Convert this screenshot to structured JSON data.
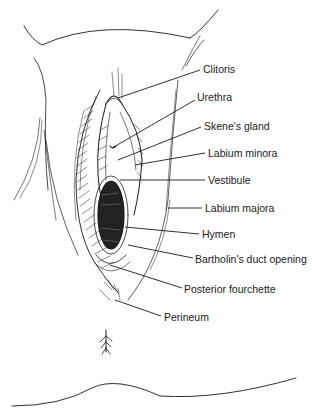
{
  "diagram": {
    "style": "black ink line drawing on white",
    "colors": {
      "ink": "#1a1a1a",
      "background": "#ffffff",
      "interior_shading": "#222222"
    },
    "labels": [
      {
        "id": "clitoris",
        "text": "Clitoris",
        "x": 203,
        "y": 64,
        "line": [
          118,
          98,
          200,
          70
        ]
      },
      {
        "id": "urethra",
        "text": "Urethra",
        "x": 197,
        "y": 92,
        "line": [
          112,
          148,
          195,
          100
        ]
      },
      {
        "id": "skenes-gland",
        "text": "Skene's gland",
        "x": 204,
        "y": 121,
        "line": [
          118,
          160,
          201,
          127
        ]
      },
      {
        "id": "labium-minora",
        "text": "Labium minora",
        "x": 208,
        "y": 148,
        "line": [
          135,
          165,
          205,
          153
        ]
      },
      {
        "id": "vestibule",
        "text": "Vestibule",
        "x": 208,
        "y": 175,
        "line": [
          120,
          180,
          205,
          180
        ]
      },
      {
        "id": "labium-majora",
        "text": "Labium majora",
        "x": 205,
        "y": 203,
        "line": [
          168,
          208,
          202,
          208
        ]
      },
      {
        "id": "hymen",
        "text": "Hymen",
        "x": 202,
        "y": 229,
        "line": [
          125,
          227,
          199,
          234
        ]
      },
      {
        "id": "bartholins-duct-opening",
        "text": "Bartholin's duct opening",
        "x": 195,
        "y": 254,
        "line": [
          128,
          245,
          193,
          258
        ]
      },
      {
        "id": "posterior-fourchette",
        "text": "Posterior fourchette",
        "x": 184,
        "y": 284,
        "line": [
          110,
          265,
          182,
          288
        ]
      },
      {
        "id": "perineum",
        "text": "Perineum",
        "x": 164,
        "y": 312,
        "line": [
          115,
          300,
          161,
          316
        ]
      }
    ]
  }
}
